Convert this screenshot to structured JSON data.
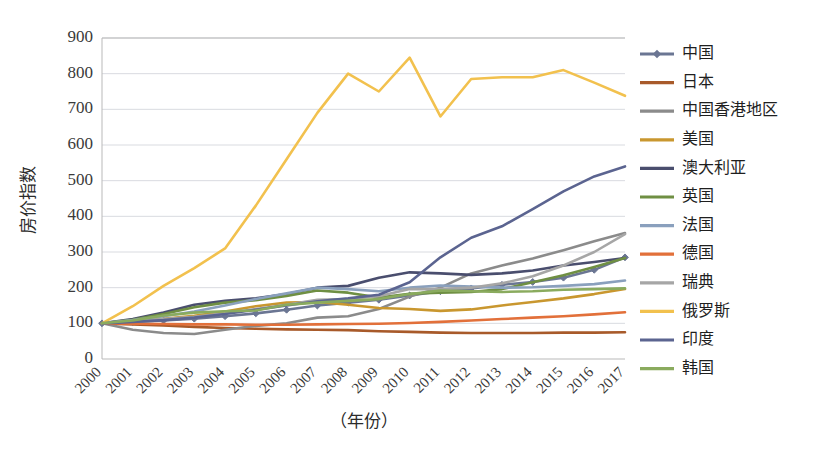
{
  "chart_data": {
    "type": "line",
    "title": "",
    "xlabel": "（年份）",
    "ylabel": "房价指数",
    "x": [
      2000,
      2001,
      2002,
      2003,
      2004,
      2005,
      2006,
      2007,
      2008,
      2009,
      2010,
      2011,
      2012,
      2013,
      2014,
      2015,
      2016,
      2017
    ],
    "xtick_labels": [
      "2000",
      "2001",
      "2002",
      "2003",
      "2004",
      "2005",
      "2006",
      "2007",
      "2008",
      "2009",
      "2010",
      "2011",
      "2012",
      "2013",
      "2014",
      "2015",
      "2016",
      "2017"
    ],
    "ylim": [
      0,
      900
    ],
    "yticks": [
      0,
      100,
      200,
      300,
      400,
      500,
      600,
      700,
      800,
      900
    ],
    "ytick_labels": [
      "0",
      "100",
      "200",
      "300",
      "400",
      "500",
      "600",
      "700",
      "800",
      "900"
    ],
    "grid": "horizontal",
    "legend_position": "right",
    "series": [
      {
        "name": "中国",
        "color": "#6b7693",
        "marker": "diamond",
        "values": [
          100,
          104,
          108,
          113,
          120,
          128,
          138,
          150,
          158,
          166,
          178,
          190,
          198,
          208,
          216,
          228,
          250,
          285
        ]
      },
      {
        "name": "日本",
        "color": "#a85a2a",
        "marker": "none",
        "values": [
          100,
          97,
          94,
          90,
          87,
          85,
          83,
          82,
          81,
          78,
          76,
          74,
          73,
          73,
          73,
          74,
          74,
          75
        ]
      },
      {
        "name": "中国香港地区",
        "color": "#8b8b8b",
        "marker": "none",
        "values": [
          100,
          82,
          73,
          70,
          82,
          93,
          100,
          116,
          120,
          140,
          175,
          200,
          240,
          262,
          282,
          305,
          330,
          353
        ]
      },
      {
        "name": "美国",
        "color": "#c9972f",
        "marker": "none",
        "values": [
          100,
          106,
          113,
          121,
          133,
          148,
          158,
          160,
          152,
          143,
          140,
          135,
          139,
          150,
          160,
          170,
          182,
          196
        ]
      },
      {
        "name": "澳大利亚",
        "color": "#4a4e6e",
        "marker": "none",
        "values": [
          100,
          112,
          130,
          152,
          163,
          170,
          182,
          200,
          205,
          228,
          243,
          240,
          236,
          240,
          248,
          262,
          272,
          283
        ]
      },
      {
        "name": "英国",
        "color": "#6f8f43",
        "marker": "none",
        "values": [
          100,
          110,
          126,
          145,
          158,
          165,
          177,
          192,
          186,
          172,
          183,
          186,
          188,
          196,
          215,
          235,
          258,
          283
        ]
      },
      {
        "name": "法国",
        "color": "#8aa0bd",
        "marker": "none",
        "values": [
          100,
          109,
          120,
          133,
          150,
          168,
          184,
          200,
          196,
          190,
          200,
          206,
          203,
          200,
          201,
          205,
          210,
          220
        ]
      },
      {
        "name": "德国",
        "color": "#e2703a",
        "marker": "none",
        "values": [
          100,
          99,
          98,
          97,
          97,
          96,
          96,
          97,
          98,
          99,
          101,
          104,
          108,
          112,
          116,
          120,
          125,
          131
        ]
      },
      {
        "name": "瑞典",
        "color": "#a6a6a6",
        "marker": "none",
        "values": [
          100,
          106,
          112,
          118,
          128,
          140,
          152,
          166,
          168,
          176,
          196,
          196,
          200,
          212,
          232,
          262,
          300,
          350
        ]
      },
      {
        "name": "俄罗斯",
        "color": "#f2c14e",
        "marker": "none",
        "values": [
          100,
          148,
          205,
          255,
          310,
          430,
          560,
          690,
          800,
          750,
          845,
          680,
          785,
          790,
          790,
          810,
          775,
          738
        ]
      },
      {
        "name": "印度",
        "color": "#5b6490",
        "marker": "none",
        "values": [
          100,
          104,
          109,
          116,
          126,
          138,
          150,
          162,
          170,
          180,
          215,
          285,
          340,
          372,
          420,
          470,
          512,
          540
        ]
      },
      {
        "name": "韩国",
        "color": "#8aab5e",
        "marker": "none",
        "values": [
          100,
          108,
          122,
          130,
          134,
          136,
          152,
          158,
          163,
          168,
          182,
          192,
          190,
          188,
          190,
          194,
          196,
          198
        ]
      }
    ]
  },
  "legend": {
    "items": [
      {
        "label": "中国"
      },
      {
        "label": "日本"
      },
      {
        "label": "中国香港地区"
      },
      {
        "label": "美国"
      },
      {
        "label": "澳大利亚"
      },
      {
        "label": "英国"
      },
      {
        "label": "法国"
      },
      {
        "label": "德国"
      },
      {
        "label": "瑞典"
      },
      {
        "label": "俄罗斯"
      },
      {
        "label": "印度"
      },
      {
        "label": "韩国"
      }
    ]
  }
}
